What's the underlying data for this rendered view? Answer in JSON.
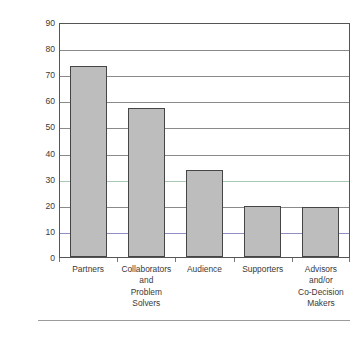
{
  "chart_data": {
    "type": "bar",
    "title": "",
    "xlabel": "",
    "ylabel": "Percentage of the Families in Schools",
    "categories": [
      "Partners",
      "Collaborators and Problem Solvers",
      "Audience",
      "Supporters",
      "Advisors and/or Co-Decision Makers"
    ],
    "category_lines": [
      [
        "Partners"
      ],
      [
        "Collaborators",
        "and",
        "Problem",
        "Solvers"
      ],
      [
        "Audience"
      ],
      [
        "Supporters"
      ],
      [
        "Advisors",
        "and/or",
        "Co-Decision",
        "Makers"
      ]
    ],
    "values": [
      73,
      57,
      33.5,
      19.5,
      19
    ],
    "ylim": [
      0,
      90
    ],
    "ytick_values": [
      0,
      10,
      20,
      30,
      40,
      50,
      60,
      70,
      80,
      90
    ],
    "ytick_labels": [
      "0",
      "10",
      "20",
      "30",
      "40",
      "50",
      "60",
      "70",
      "80",
      "90"
    ],
    "grid": true,
    "legend": "none",
    "colors": {
      "bar_fill": "#bdbdbd",
      "bar_border": "#454545",
      "gridline": "#8a8a8a",
      "gridline_tint_green": "#a9c9b4",
      "gridline_tint_blue": "#8f8fc4",
      "frame": "#555555",
      "text": "#3a3a3a",
      "background": "#ffffff",
      "footer_rule": "#9b9b9b"
    }
  }
}
